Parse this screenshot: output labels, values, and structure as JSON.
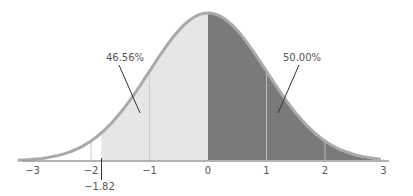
{
  "chart_data": {
    "type": "area",
    "title": "",
    "xlabel": "",
    "ylabel": "",
    "x_ticks": [
      -3,
      -2,
      -1,
      0,
      1,
      2,
      3
    ],
    "x_tick_labels": [
      "−3",
      "−2",
      "−1",
      "0",
      "1",
      "2",
      "3"
    ],
    "xlim": [
      -3,
      3
    ],
    "grid": false,
    "regions": [
      {
        "from": -1.82,
        "to": 0,
        "label": "46.56%",
        "color": "#e6e6e6"
      },
      {
        "from": 0,
        "to": 3,
        "label": "50.00%",
        "color": "#7a7a7a"
      }
    ],
    "marker": {
      "x": -1.82,
      "label": "−1.82"
    },
    "annotations": [
      {
        "text": "46.56%",
        "region": 0
      },
      {
        "text": "50.00%",
        "region": 1
      }
    ],
    "colors": {
      "curve": "#aaaaaa",
      "light_fill": "#e6e6e6",
      "dark_fill": "#7a7a7a",
      "axis": "#999999",
      "text": "#555555"
    }
  }
}
